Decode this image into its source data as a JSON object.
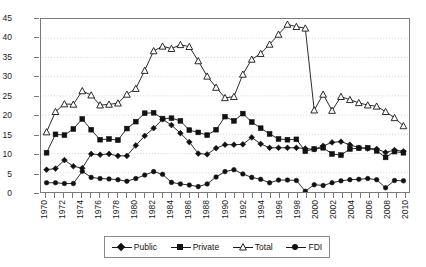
{
  "chart_data": {
    "type": "line",
    "title": "",
    "xlabel": "",
    "ylabel": "",
    "xlim": [
      1970,
      2010
    ],
    "ylim": [
      0,
      45
    ],
    "ytick_step": 5,
    "xtick_label_step": 2,
    "grid": true,
    "grid_style": "dotted-horizontal",
    "legend_position": "bottom",
    "x": [
      1970,
      1971,
      1972,
      1973,
      1974,
      1975,
      1976,
      1977,
      1978,
      1979,
      1980,
      1981,
      1982,
      1983,
      1984,
      1985,
      1986,
      1987,
      1988,
      1989,
      1990,
      1991,
      1992,
      1993,
      1994,
      1995,
      1996,
      1997,
      1998,
      1999,
      2000,
      2001,
      2002,
      2003,
      2004,
      2005,
      2006,
      2007,
      2008,
      2009,
      2010
    ],
    "xticklabels": [
      "1970",
      "1972",
      "1974",
      "1976",
      "1978",
      "1980",
      "1982",
      "1984",
      "1986",
      "1988",
      "1990",
      "1992",
      "1994",
      "1996",
      "1998",
      "2000",
      "2002",
      "2004",
      "2006",
      "2008",
      "2010"
    ],
    "yticklabels": [
      "0",
      "5",
      "10",
      "15",
      "20",
      "25",
      "30",
      "35",
      "40",
      "45"
    ],
    "series": [
      {
        "name": "Public",
        "marker": "diamond",
        "marker_filled": true,
        "color": "#111111",
        "values": [
          5.8,
          6.1,
          8.3,
          6.7,
          6.2,
          9.9,
          9.7,
          9.9,
          9.4,
          9.4,
          12.1,
          14.6,
          16.6,
          18.9,
          17.4,
          15.3,
          13.0,
          10.0,
          9.8,
          11.4,
          12.3,
          12.3,
          12.4,
          14.2,
          12.5,
          11.5,
          11.5,
          11.5,
          11.5,
          11.3,
          11.1,
          12.0,
          12.9,
          13.1,
          12.3,
          11.5,
          11.3,
          11.2,
          10.3,
          10.9,
          10.6
        ]
      },
      {
        "name": "Private",
        "marker": "square",
        "marker_filled": true,
        "color": "#111111",
        "values": [
          10.2,
          15.0,
          14.8,
          16.4,
          19.0,
          16.2,
          13.6,
          13.8,
          13.5,
          16.5,
          18.3,
          20.5,
          20.6,
          19.1,
          19.2,
          18.5,
          16.1,
          15.5,
          14.8,
          16.2,
          19.6,
          18.5,
          20.4,
          18.2,
          16.6,
          15.1,
          13.8,
          13.6,
          13.7,
          10.6,
          11.2,
          11.5,
          9.9,
          9.6,
          11.2,
          11.4,
          11.5,
          10.7,
          9.0,
          10.5,
          10.2
        ]
      },
      {
        "name": "Total",
        "marker": "triangle",
        "marker_filled": false,
        "color": "#111111",
        "values": [
          15.6,
          20.9,
          22.9,
          22.8,
          26.3,
          25.2,
          22.6,
          22.8,
          23.1,
          25.4,
          26.9,
          31.6,
          36.7,
          37.9,
          37.3,
          38.3,
          37.8,
          34.1,
          30.1,
          27.2,
          24.5,
          24.8,
          30.6,
          34.5,
          36.0,
          38.4,
          41.0,
          43.6,
          43.0,
          42.6,
          21.3,
          25.4,
          21.2,
          24.8,
          24.0,
          23.2,
          22.6,
          22.3,
          20.9,
          19.3,
          17.2
        ]
      },
      {
        "name": "FDI",
        "marker": "circle",
        "marker_filled": true,
        "color": "#111111",
        "values": [
          2.4,
          2.4,
          2.2,
          2.2,
          5.4,
          3.8,
          3.5,
          3.4,
          3.2,
          2.8,
          3.5,
          4.4,
          5.3,
          4.6,
          2.5,
          2.1,
          1.8,
          1.4,
          2.1,
          3.9,
          5.3,
          5.8,
          4.7,
          3.8,
          3.3,
          2.4,
          3.1,
          3.1,
          3.0,
          0.2,
          1.9,
          1.7,
          2.4,
          2.9,
          3.2,
          3.3,
          3.5,
          3.2,
          1.1,
          3.0,
          2.9
        ]
      }
    ]
  },
  "legend": {
    "items": [
      {
        "label": "Public",
        "marker": "diamond-marker"
      },
      {
        "label": "Private",
        "marker": "square-marker"
      },
      {
        "label": "Total",
        "marker": "triangle-marker"
      },
      {
        "label": "FDI",
        "marker": "circle-marker"
      }
    ]
  }
}
